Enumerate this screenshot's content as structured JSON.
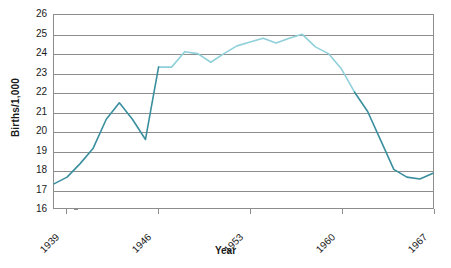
{
  "chart_data": {
    "type": "line",
    "title": "",
    "xlabel": "Year",
    "ylabel": "Births/1,000",
    "xlim": [
      1938,
      1967
    ],
    "ylim": [
      16,
      26
    ],
    "grid": true,
    "legend": false,
    "y_ticks": [
      26,
      25,
      24,
      23,
      22,
      21,
      20,
      19,
      18,
      17,
      16
    ],
    "x_ticks": [
      1939,
      1946,
      1953,
      1960,
      1967
    ],
    "x_tick_labels": [
      "1939",
      "1946",
      "1953",
      "1960",
      "1967"
    ],
    "colors": {
      "line_dark": "#3a8f9e",
      "line_light": "#8fd0da",
      "axis": "#8d8d8d",
      "text": "#1a1a1a",
      "background": "#ffffff"
    },
    "series": [
      {
        "name": "Births per 1,000 population",
        "x": [
          1938,
          1939,
          1940,
          1941,
          1942,
          1943,
          1944,
          1945,
          1946,
          1947,
          1948,
          1949,
          1950,
          1951,
          1952,
          1953,
          1954,
          1955,
          1956,
          1957,
          1958,
          1959,
          1960,
          1961,
          1962,
          1963,
          1964,
          1965,
          1966,
          1967
        ],
        "values": [
          17.25,
          17.6,
          18.3,
          19.1,
          20.6,
          21.45,
          20.6,
          19.55,
          23.3,
          23.3,
          24.1,
          24.0,
          23.55,
          24.0,
          24.4,
          24.6,
          24.8,
          24.55,
          24.8,
          25.0,
          24.35,
          24.0,
          23.2,
          22.0,
          21.0,
          19.5,
          18.0,
          17.6,
          17.5,
          17.8
        ],
        "segment_color_dark_ranges": [
          [
            1938,
            1946
          ],
          [
            1961,
            1967
          ]
        ],
        "segment_color_light_ranges": [
          [
            1946,
            1961
          ]
        ]
      }
    ],
    "annotations": {
      "peak_value": 25.0,
      "peak_year": 1957,
      "min_value": 17.25,
      "min_year": 1938,
      "wartime_dip_value": 19.55,
      "wartime_dip_year": 1945
    }
  },
  "axis_titles": {
    "y": "Births/1,000",
    "x": "Year"
  }
}
